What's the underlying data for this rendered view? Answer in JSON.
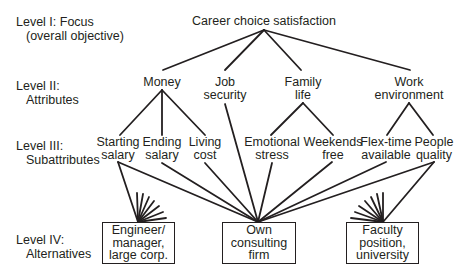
{
  "levels": [
    {
      "title": "Level I: Focus",
      "subtitle": "(overall objective)"
    },
    {
      "title": "Level II:",
      "subtitle": "Attributes"
    },
    {
      "title": "Level III:",
      "subtitle": "Subattributes"
    },
    {
      "title": "Level IV:",
      "subtitle": "Alternatives"
    }
  ],
  "focus": {
    "label": "Career choice satisfaction"
  },
  "attributes": [
    {
      "line1": "Money",
      "line2": ""
    },
    {
      "line1": "Job",
      "line2": "security"
    },
    {
      "line1": "Family",
      "line2": "life"
    },
    {
      "line1": "Work",
      "line2": "environment"
    }
  ],
  "subattributes": [
    {
      "line1": "Starting",
      "line2": "salary"
    },
    {
      "line1": "Ending",
      "line2": "salary"
    },
    {
      "line1": "Living",
      "line2": "cost"
    },
    {
      "line1": "Emotional",
      "line2": "stress"
    },
    {
      "line1": "Weekends",
      "line2": "free"
    },
    {
      "line1": "Flex-time",
      "line2": "available"
    },
    {
      "line1": "People",
      "line2": "quality"
    }
  ],
  "alternatives": [
    {
      "line1": "Engineer/",
      "line2": "manager,",
      "line3": "large corp."
    },
    {
      "line1": "Own",
      "line2": "consulting",
      "line3": "firm"
    },
    {
      "line1": "Faculty",
      "line2": "position,",
      "line3": "university"
    }
  ],
  "colors": {
    "ink": "#231f20",
    "background": "#ffffff"
  }
}
